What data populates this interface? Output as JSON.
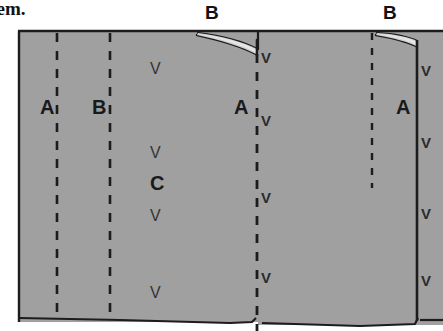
{
  "figure": {
    "caption_fragment": "hem.",
    "colors": {
      "fabric_fill": "#a0a0a0",
      "outline": "#1c1c1c",
      "label_text": "#1a1a1a",
      "page_background": "#ffffff",
      "mark_text": "#2b2b2b"
    },
    "panel": {
      "left": 18,
      "top": 31,
      "right": 443,
      "bottom": 322
    },
    "top_labels": [
      {
        "id": "top-label-b-1",
        "text": "B",
        "x": 205,
        "y": 2
      },
      {
        "id": "top-label-b-2",
        "text": "B",
        "x": 383,
        "y": 2
      }
    ],
    "panel_labels": [
      {
        "id": "panel-label-a-1",
        "text": "A",
        "x": 40,
        "y": 96
      },
      {
        "id": "panel-label-b-1",
        "text": "B",
        "x": 92,
        "y": 96
      },
      {
        "id": "panel-label-a-2",
        "text": "A",
        "x": 234,
        "y": 96
      },
      {
        "id": "panel-label-a-3",
        "text": "A",
        "x": 396,
        "y": 96
      },
      {
        "id": "panel-label-c-1",
        "text": "C",
        "x": 150,
        "y": 172
      }
    ],
    "fold_lines": [
      {
        "id": "fold-dashed-a-1",
        "style": "dashed",
        "x": 57,
        "y_top": 33,
        "y_bottom": 320
      },
      {
        "id": "fold-dashed-b-1",
        "style": "dashed",
        "x": 110,
        "y_top": 33,
        "y_bottom": 320
      },
      {
        "id": "fold-dashed-a-2",
        "style": "dashed",
        "x": 258,
        "y_top": 52,
        "y_bottom": 331
      },
      {
        "id": "fold-dashed-b-2",
        "style": "dashed",
        "x": 372,
        "y_top": 33,
        "y_bottom": 188
      },
      {
        "id": "fold-solid-edge-1",
        "style": "solid",
        "x": 258,
        "y_top": 31,
        "y_bottom": 52
      },
      {
        "id": "fold-solid-edge-2",
        "style": "solid",
        "x": 417,
        "y_top": 40,
        "y_bottom": 322
      }
    ],
    "stitch_marks": [
      {
        "id": "stitch-mark-c-1",
        "glyph": "V",
        "x": 150,
        "y": 60
      },
      {
        "id": "stitch-mark-c-2",
        "glyph": "V",
        "x": 150,
        "y": 144
      },
      {
        "id": "stitch-mark-c-3",
        "glyph": "V",
        "x": 150,
        "y": 207
      },
      {
        "id": "stitch-mark-c-4",
        "glyph": "V",
        "x": 150,
        "y": 284
      },
      {
        "id": "stitch-mark-a2-1",
        "glyph": "V",
        "x": 261,
        "y": 49
      },
      {
        "id": "stitch-mark-a2-2",
        "glyph": "V",
        "x": 261,
        "y": 112
      },
      {
        "id": "stitch-mark-a2-3",
        "glyph": "V",
        "x": 261,
        "y": 189
      },
      {
        "id": "stitch-mark-a2-4",
        "glyph": "V",
        "x": 261,
        "y": 269
      },
      {
        "id": "stitch-mark-a3-1",
        "glyph": "V",
        "x": 421,
        "y": 62
      },
      {
        "id": "stitch-mark-a3-2",
        "glyph": "V",
        "x": 421,
        "y": 134
      },
      {
        "id": "stitch-mark-a3-3",
        "glyph": "V",
        "x": 421,
        "y": 205
      },
      {
        "id": "stitch-mark-a3-4",
        "glyph": "V",
        "x": 421,
        "y": 272
      }
    ],
    "pleats": [
      {
        "id": "pleat-fold-1",
        "start_x": 198,
        "end_x": 258,
        "top_y": 31
      },
      {
        "id": "pleat-fold-2",
        "start_x": 377,
        "end_x": 417,
        "top_y": 31
      }
    ]
  }
}
